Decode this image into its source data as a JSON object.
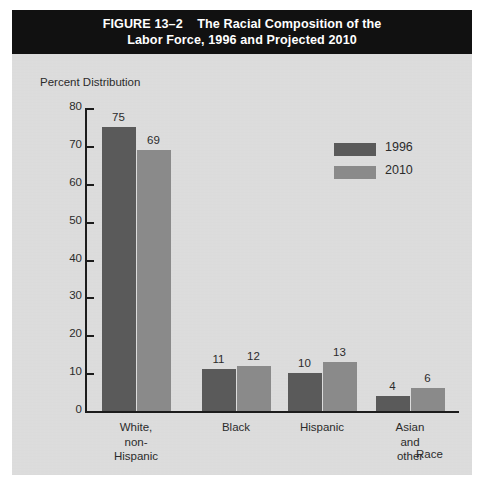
{
  "figure": {
    "title_line1": "FIGURE 13–2    The Racial Composition of the",
    "title_line2": "Labor Force, 1996 and Projected 2010",
    "background_color": "#dcdcdc",
    "titlebar_color": "#111111",
    "titlebar_text_color": "#ffffff"
  },
  "chart_data": {
    "type": "bar",
    "title": "FIGURE 13–2 The Racial Composition of the Labor Force, 1996 and Projected 2010",
    "categories": [
      "White, non-Hispanic",
      "Black",
      "Hispanic",
      "Asian and other"
    ],
    "category_lines": [
      [
        "White,",
        "non-",
        "Hispanic"
      ],
      [
        "Black"
      ],
      [
        "Hispanic"
      ],
      [
        "Asian",
        "and",
        "other"
      ]
    ],
    "series": [
      {
        "name": "1996",
        "values": [
          75,
          11,
          10,
          4
        ],
        "color": "#5a5a5a"
      },
      {
        "name": "2010",
        "values": [
          69,
          12,
          13,
          6
        ],
        "color": "#8a8a8a"
      }
    ],
    "xlabel": "Race",
    "ylabel": "Percent Distribution",
    "ylim": [
      0,
      80
    ],
    "yticks": [
      0,
      10,
      20,
      30,
      40,
      50,
      60,
      70,
      80
    ],
    "ytick_labels": [
      "0",
      "10",
      "20",
      "30",
      "40",
      "50",
      "60",
      "70",
      "80"
    ],
    "grid": false,
    "legend_position": "upper-right",
    "value_labels_shown": true
  }
}
